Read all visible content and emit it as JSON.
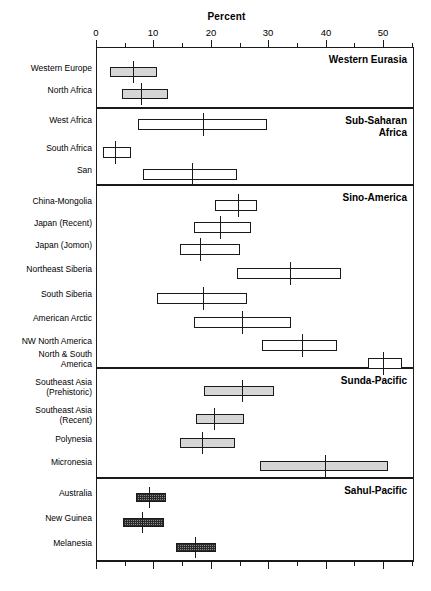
{
  "chart_data": {
    "type": "box",
    "title": "Percent",
    "xlabel": "Percent",
    "ylabel": "",
    "xlim": [
      0,
      55
    ],
    "xticks_major": [
      0,
      10,
      20,
      30,
      40,
      50
    ],
    "xtick_labels": [
      "0",
      "10",
      "20",
      "30",
      "40",
      "50"
    ],
    "xticks_minor": [
      5,
      15,
      25,
      35,
      45,
      55
    ],
    "grid": false,
    "legend": "none",
    "panel_title_position": "top-right",
    "panels": [
      {
        "name": "Western Eurasia",
        "fill": "light",
        "rows": [
          {
            "label": "Western Europe",
            "low": 2.4,
            "high": 10.6,
            "median": 6.4
          },
          {
            "label": "North Africa",
            "low": 4.5,
            "high": 12.5,
            "median": 7.8
          }
        ]
      },
      {
        "name": "Sub-Saharan Africa",
        "name_lines": [
          "Sub-Saharan",
          "Africa"
        ],
        "fill": "none",
        "rows": [
          {
            "label": "West Africa",
            "low": 7.3,
            "high": 29.8,
            "median": 18.7
          },
          {
            "label": "South Africa",
            "low": 1.2,
            "high": 6.1,
            "median": 3.3
          },
          {
            "label": "San",
            "low": 8.2,
            "high": 24.6,
            "median": 16.7
          }
        ]
      },
      {
        "name": "Sino-America",
        "fill": "none",
        "rows": [
          {
            "label": "China-Mongolia",
            "low": 20.7,
            "high": 28.0,
            "median": 24.7
          },
          {
            "label": "Japan (Recent)",
            "low": 17.1,
            "high": 27.0,
            "median": 21.6
          },
          {
            "label": "Japan (Jomon)",
            "low": 14.6,
            "high": 25.1,
            "median": 18.1
          },
          {
            "label": "Northeast Siberia",
            "low": 24.6,
            "high": 42.7,
            "median": 33.8
          },
          {
            "label": "South Siberia",
            "low": 10.6,
            "high": 26.3,
            "median": 18.6
          },
          {
            "label": "American Arctic",
            "low": 17.1,
            "high": 34.0,
            "median": 25.5
          },
          {
            "label": "NW North America",
            "low": 28.9,
            "high": 42.0,
            "median": 35.9
          },
          {
            "label": "North & South America",
            "label_lines": [
              "North & South",
              "America"
            ],
            "low": 47.4,
            "high": 53.3,
            "median": 50.0
          }
        ]
      },
      {
        "name": "Sunda-Pacific",
        "fill": "light",
        "rows": [
          {
            "label": "Southeast Asia (Prehistoric)",
            "label_lines": [
              "Southeast Asia",
              "(Prehistoric)"
            ],
            "low": 18.8,
            "high": 31.0,
            "median": 25.4
          },
          {
            "label": "Southeast Asia (Recent)",
            "label_lines": [
              "Southeast Asia",
              "(Recent)"
            ],
            "low": 17.4,
            "high": 25.8,
            "median": 20.5
          },
          {
            "label": "Polynesia",
            "low": 14.6,
            "high": 24.2,
            "median": 18.4
          },
          {
            "label": "Micronesia",
            "low": 28.6,
            "high": 50.9,
            "median": 39.9
          }
        ]
      },
      {
        "name": "Sahul-Pacific",
        "fill": "hatch",
        "rows": [
          {
            "label": "Australia",
            "low": 6.9,
            "high": 12.2,
            "median": 9.2
          },
          {
            "label": "New Guinea",
            "low": 4.7,
            "high": 11.9,
            "median": 8.1
          },
          {
            "label": "Melanesia",
            "low": 14.0,
            "high": 21.0,
            "median": 17.3
          }
        ]
      }
    ]
  }
}
